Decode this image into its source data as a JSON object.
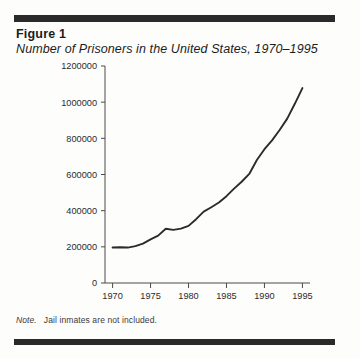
{
  "figure": {
    "label": "Figure 1",
    "subtitle": "Number of Prisoners in the United States, 1970–1995",
    "note_word": "Note.",
    "note_text": "Jail inmates are not included."
  },
  "colors": {
    "rule": "#2a2a2a",
    "line": "#2b2b2b",
    "axis": "#4a4a4a",
    "text": "#1c1c1c",
    "background": "#fdfdfc"
  },
  "chart_data": {
    "type": "line",
    "title": "Number of Prisoners in the United States, 1970–1995",
    "xlabel": "",
    "ylabel": "",
    "xlim": [
      1969,
      1996
    ],
    "ylim": [
      0,
      1200000
    ],
    "grid": false,
    "legend": "none",
    "xticks": [
      1970,
      1975,
      1980,
      1985,
      1990,
      1995
    ],
    "xtick_labels": [
      "1970",
      "1975",
      "1980",
      "1985",
      "1990",
      "1995"
    ],
    "yticks": [
      0,
      200000,
      400000,
      600000,
      800000,
      1000000,
      1200000
    ],
    "ytick_labels": [
      "0",
      "200000",
      "400000",
      "600000",
      "800000",
      "1000000",
      "1200000"
    ],
    "x": [
      1970,
      1971,
      1972,
      1973,
      1974,
      1975,
      1976,
      1977,
      1978,
      1979,
      1980,
      1981,
      1982,
      1983,
      1984,
      1985,
      1986,
      1987,
      1988,
      1989,
      1990,
      1991,
      1992,
      1993,
      1994,
      1995
    ],
    "series": [
      {
        "name": "Prisoners",
        "values": [
          196000,
          198000,
          196000,
          204000,
          218000,
          241000,
          262000,
          300000,
          294000,
          301000,
          316000,
          353000,
          395000,
          419000,
          445000,
          480000,
          522000,
          560000,
          603000,
          680000,
          740000,
          789000,
          846000,
          909000,
          991000,
          1078000
        ]
      }
    ],
    "annotations": []
  }
}
